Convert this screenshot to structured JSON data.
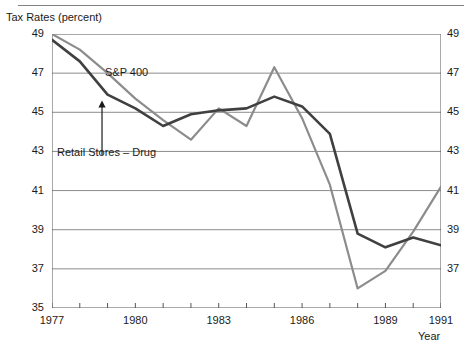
{
  "figure": {
    "y_axis_title": "Tax Rates (percent)",
    "x_axis_title": "Year",
    "series_label_snp": "S&P 400",
    "series_label_retail": "Retail Stores – Drug",
    "colors": {
      "snp": "#8c8c8c",
      "retail": "#404040",
      "grid": "#8c8c8c",
      "axis": "#555555",
      "text": "#1a1a1a"
    }
  },
  "chart_data": {
    "type": "line",
    "title": "",
    "xlabel": "Year",
    "ylabel": "Tax Rates (percent)",
    "xlim": [
      1977,
      1991
    ],
    "ylim": [
      35,
      49
    ],
    "yticks": [
      35,
      37,
      39,
      41,
      43,
      45,
      47,
      49
    ],
    "ytick_labels": [
      "35",
      "37",
      "39",
      "41",
      "43",
      "45",
      "47",
      "49"
    ],
    "xticks": [
      1977,
      1978,
      1979,
      1980,
      1981,
      1982,
      1983,
      1984,
      1985,
      1986,
      1987,
      1988,
      1989,
      1990,
      1991
    ],
    "xtick_labels_shown": [
      "1977",
      "1980",
      "1983",
      "1986",
      "1989",
      "1991"
    ],
    "grid": "horizontal",
    "legend": "inline-annotations",
    "x": [
      1977,
      1978,
      1979,
      1980,
      1981,
      1982,
      1983,
      1984,
      1985,
      1986,
      1987,
      1988,
      1989,
      1990,
      1991
    ],
    "series": [
      {
        "name": "S&P 400",
        "color": "#8c8c8c",
        "values": [
          49.0,
          48.2,
          47.0,
          45.7,
          44.6,
          43.6,
          45.2,
          44.3,
          47.3,
          44.7,
          41.3,
          36.0,
          36.9,
          38.9,
          41.2
        ]
      },
      {
        "name": "Retail Stores – Drug",
        "color": "#404040",
        "values": [
          48.7,
          47.6,
          45.9,
          45.2,
          44.3,
          44.9,
          45.1,
          45.2,
          45.8,
          45.3,
          43.9,
          38.8,
          38.1,
          38.6,
          38.2
        ]
      }
    ],
    "annotations": [
      {
        "text": "S&P 400",
        "x": 1980.5,
        "y": 46.9
      },
      {
        "text": "Retail Stores – Drug",
        "x": 1977.2,
        "y": 42.6,
        "arrow_to": [
          1978.8,
          45.6
        ]
      }
    ]
  }
}
